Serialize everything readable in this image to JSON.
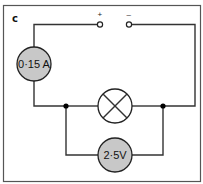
{
  "figure": {
    "panel_label": "c",
    "supply": {
      "positive_label": "+",
      "negative_label": "–"
    },
    "ammeter": {
      "reading": "0·15 A",
      "fill_color": "#c8c8c8"
    },
    "lamp": {
      "symbol": "filament-lamp"
    },
    "voltmeter": {
      "reading": "2·5V",
      "fill_color": "#c8c8c8"
    },
    "colors": {
      "wire": "#333333",
      "frame": "#555555",
      "junction": "#000000"
    }
  }
}
